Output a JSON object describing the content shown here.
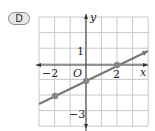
{
  "option_label": "D",
  "chart_data": {
    "type": "line",
    "title": "",
    "xlabel": "x",
    "ylabel": "y",
    "xlim": [
      -3,
      4
    ],
    "ylim": [
      -4,
      3
    ],
    "grid": true,
    "tick_labels": {
      "x": [
        "-2",
        "2"
      ],
      "y": [
        "1",
        "-3"
      ],
      "origin": "O"
    },
    "series": [
      {
        "name": "line",
        "x": [
          -3,
          4
        ],
        "y": [
          -2.5,
          1
        ],
        "slope": 0.5,
        "intercept": -1
      }
    ],
    "points": [
      {
        "x": -2,
        "y": -2
      },
      {
        "x": 0,
        "y": -1
      },
      {
        "x": 2,
        "y": 0
      }
    ]
  },
  "labels": {
    "x": "x",
    "y": "y",
    "origin": "O",
    "xneg2": "−2",
    "x2": "2",
    "y1": "1",
    "yneg3": "−3"
  }
}
